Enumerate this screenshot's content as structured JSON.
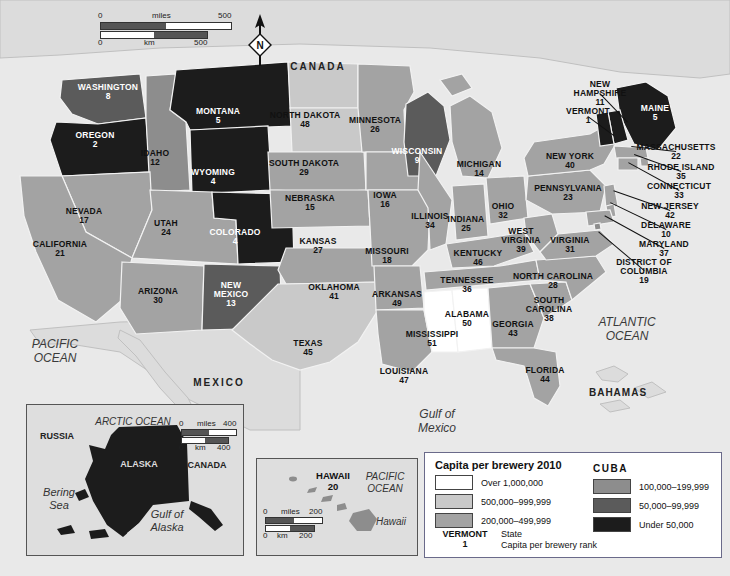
{
  "map": {
    "title": "Capita per brewery 2010",
    "countries": [
      {
        "name": "CANADA",
        "x": 318,
        "y": 66
      },
      {
        "name": "MEXICO",
        "x": 219,
        "y": 382
      },
      {
        "name": "BAHAMAS",
        "x": 618,
        "y": 392
      }
    ],
    "oceans": [
      {
        "name": "PACIFIC\nOCEAN",
        "x": 55,
        "y": 352
      },
      {
        "name": "ATLANTIC\nOCEAN",
        "x": 627,
        "y": 330
      },
      {
        "name": "Gulf of\nMexico",
        "x": 437,
        "y": 422
      }
    ],
    "scale_main": {
      "miles_label": "miles",
      "km_label": "km",
      "miles_min": "0",
      "miles_max": "500",
      "km_min": "0",
      "km_max": "500"
    },
    "compass": {
      "label": "N"
    }
  },
  "states": [
    {
      "name": "WASHINGTON",
      "rank": "8",
      "x": 108,
      "y": 92,
      "tone": "dark"
    },
    {
      "name": "OREGON",
      "rank": "2",
      "x": 95,
      "y": 140,
      "tone": "dark"
    },
    {
      "name": "IDAHO",
      "rank": "12",
      "x": 155,
      "y": 158,
      "tone": "light"
    },
    {
      "name": "MONTANA",
      "rank": "5",
      "x": 218,
      "y": 116,
      "tone": "dark"
    },
    {
      "name": "WYOMING",
      "rank": "4",
      "x": 213,
      "y": 177,
      "tone": "dark"
    },
    {
      "name": "NEVADA",
      "rank": "17",
      "x": 84,
      "y": 216,
      "tone": "light"
    },
    {
      "name": "UTAH",
      "rank": "24",
      "x": 166,
      "y": 228,
      "tone": "light"
    },
    {
      "name": "CALIFORNIA",
      "rank": "21",
      "x": 60,
      "y": 249,
      "tone": "light"
    },
    {
      "name": "COLORADO",
      "rank": "4",
      "x": 235,
      "y": 237,
      "tone": "dark"
    },
    {
      "name": "ARIZONA",
      "rank": "30",
      "x": 158,
      "y": 296,
      "tone": "light"
    },
    {
      "name": "NEW\nMEXICO",
      "rank": "13",
      "x": 231,
      "y": 294,
      "tone": "dark"
    },
    {
      "name": "NORTH DAKOTA",
      "rank": "48",
      "x": 305,
      "y": 120,
      "tone": "light"
    },
    {
      "name": "SOUTH DAKOTA",
      "rank": "29",
      "x": 304,
      "y": 168,
      "tone": "light"
    },
    {
      "name": "NEBRASKA",
      "rank": "15",
      "x": 310,
      "y": 203,
      "tone": "light"
    },
    {
      "name": "KANSAS",
      "rank": "27",
      "x": 318,
      "y": 246,
      "tone": "light"
    },
    {
      "name": "OKLAHOMA",
      "rank": "41",
      "x": 334,
      "y": 292,
      "tone": "light"
    },
    {
      "name": "TEXAS",
      "rank": "45",
      "x": 308,
      "y": 348,
      "tone": "light"
    },
    {
      "name": "MINNESOTA",
      "rank": "26",
      "x": 375,
      "y": 125,
      "tone": "light"
    },
    {
      "name": "IOWA",
      "rank": "16",
      "x": 385,
      "y": 200,
      "tone": "light"
    },
    {
      "name": "MISSOURI",
      "rank": "18",
      "x": 387,
      "y": 256,
      "tone": "light"
    },
    {
      "name": "ARKANSAS",
      "rank": "49",
      "x": 397,
      "y": 299,
      "tone": "light"
    },
    {
      "name": "LOUISIANA",
      "rank": "47",
      "x": 404,
      "y": 376,
      "tone": "light"
    },
    {
      "name": "WISCONSIN",
      "rank": "9",
      "x": 417,
      "y": 156,
      "tone": "dark"
    },
    {
      "name": "ILLINOIS",
      "rank": "34",
      "x": 430,
      "y": 221,
      "tone": "light"
    },
    {
      "name": "MICHIGAN",
      "rank": "14",
      "x": 479,
      "y": 169,
      "tone": "light"
    },
    {
      "name": "INDIANA",
      "rank": "25",
      "x": 466,
      "y": 224,
      "tone": "light"
    },
    {
      "name": "OHIO",
      "rank": "32",
      "x": 503,
      "y": 211,
      "tone": "light"
    },
    {
      "name": "KENTUCKY",
      "rank": "46",
      "x": 478,
      "y": 258,
      "tone": "light"
    },
    {
      "name": "TENNESSEE",
      "rank": "36",
      "x": 467,
      "y": 285,
      "tone": "light"
    },
    {
      "name": "MISSISSIPPI",
      "rank": "51",
      "x": 432,
      "y": 339,
      "tone": "light"
    },
    {
      "name": "ALABAMA",
      "rank": "50",
      "x": 467,
      "y": 319,
      "tone": "light"
    },
    {
      "name": "GEORGIA",
      "rank": "43",
      "x": 513,
      "y": 329,
      "tone": "light"
    },
    {
      "name": "FLORIDA",
      "rank": "44",
      "x": 545,
      "y": 375,
      "tone": "light"
    },
    {
      "name": "SOUTH\nCAROLINA",
      "rank": "38",
      "x": 549,
      "y": 309,
      "tone": "light"
    },
    {
      "name": "NORTH CAROLINA",
      "rank": "28",
      "x": 553,
      "y": 281,
      "tone": "light"
    },
    {
      "name": "WEST\nVIRGINIA",
      "rank": "39",
      "x": 521,
      "y": 240,
      "tone": "light"
    },
    {
      "name": "VIRGINIA",
      "rank": "31",
      "x": 570,
      "y": 245,
      "tone": "light"
    },
    {
      "name": "PENNSYLVANIA",
      "rank": "23",
      "x": 568,
      "y": 193,
      "tone": "light"
    },
    {
      "name": "NEW YORK",
      "rank": "40",
      "x": 570,
      "y": 161,
      "tone": "light"
    },
    {
      "name": "MAINE",
      "rank": "5",
      "x": 655,
      "y": 113,
      "tone": "dark"
    }
  ],
  "callout_states": [
    {
      "name": "NEW\nHAMPSHIRE",
      "rank": "11",
      "x": 600,
      "y": 93,
      "tx": 628,
      "ty": 122
    },
    {
      "name": "VERMONT",
      "rank": "1",
      "x": 588,
      "y": 116,
      "tx": 614,
      "ty": 135
    },
    {
      "name": "MASSACHUSETTS",
      "rank": "22",
      "x": 676,
      "y": 152,
      "tx": 631,
      "ty": 147
    },
    {
      "name": "RHODE ISLAND",
      "rank": "35",
      "x": 681,
      "y": 172,
      "tx": 634,
      "ty": 155
    },
    {
      "name": "CONNECTICUT",
      "rank": "33",
      "x": 679,
      "y": 191,
      "tx": 628,
      "ty": 163
    },
    {
      "name": "NEW JERSEY",
      "rank": "42",
      "x": 670,
      "y": 211,
      "tx": 613,
      "ty": 191
    },
    {
      "name": "DELAWARE",
      "rank": "10",
      "x": 666,
      "y": 230,
      "tx": 610,
      "ty": 203
    },
    {
      "name": "MARYLAND",
      "rank": "37",
      "x": 664,
      "y": 249,
      "tx": 604,
      "ty": 216
    },
    {
      "name": "DISTRICT OF\nCOLUMBIA",
      "rank": "19",
      "x": 644,
      "y": 271,
      "tx": 598,
      "ty": 232
    }
  ],
  "alaska_inset": {
    "labels": [
      {
        "text": "ARCTIC OCEAN",
        "x": 130,
        "y": 419,
        "style": "italic"
      },
      {
        "text": "RUSSIA",
        "x": 54,
        "y": 434,
        "style": "bold"
      },
      {
        "text": "CANADA",
        "x": 203,
        "y": 463,
        "style": "bold"
      },
      {
        "text": "ALASKA",
        "x": 136,
        "y": 462,
        "style": "bold-white"
      },
      {
        "text": "Bering\nSea",
        "x": 56,
        "y": 497,
        "style": "italic"
      },
      {
        "text": "Gulf of\nAlaska",
        "x": 163,
        "y": 518,
        "style": "italic"
      }
    ],
    "scale": {
      "miles_label": "miles",
      "km_label": "km",
      "miles_min": "0",
      "miles_max": "400",
      "km_min": "0",
      "km_max": "400"
    }
  },
  "hawaii_inset": {
    "name": "HAWAII",
    "rank": "20",
    "ocean": "PACIFIC\nOCEAN",
    "island": "Hawaii",
    "scale": {
      "miles_label": "miles",
      "km_label": "km",
      "miles_min": "0",
      "miles_max": "200",
      "km_min": "0",
      "km_max": "200"
    }
  },
  "legend": {
    "title": "Capita per brewery 2010",
    "cuba_label": "CUBA",
    "left_items": [
      {
        "label": "Over 1,000,000",
        "color": "#ffffff"
      },
      {
        "label": "500,000–999,999",
        "color": "#c9c9c9"
      },
      {
        "label": "200,000–499,999",
        "color": "#a3a3a3"
      }
    ],
    "right_items": [
      {
        "label": "100,000–199,999",
        "color": "#8d8d8d"
      },
      {
        "label": "50,000–99,999",
        "color": "#5b5b5b"
      },
      {
        "label": "Under 50,000",
        "color": "#1c1c1c"
      }
    ],
    "sample_state": "VERMONT",
    "sample_rank": "1",
    "sample_desc": "State\nCapita per brewery rank"
  }
}
